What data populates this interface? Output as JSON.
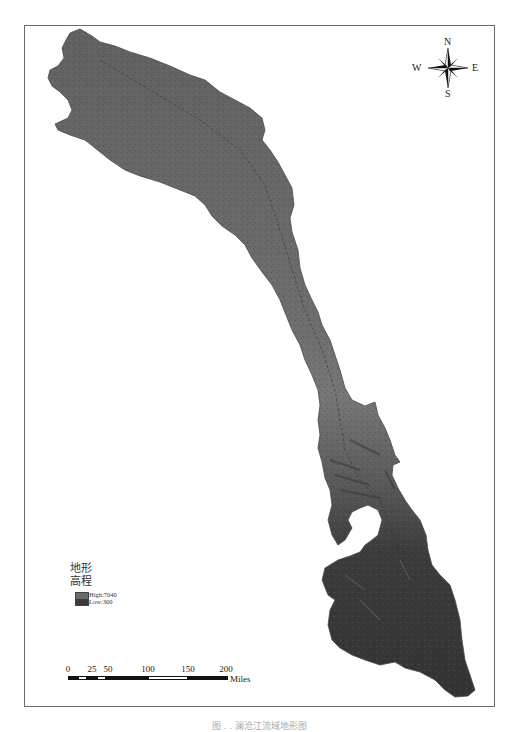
{
  "map": {
    "title": "",
    "colors": {
      "frame": "#6a6a6a",
      "terrain_high": "#6a6a6a",
      "terrain_mid": "#757575",
      "terrain_low": "#353535",
      "background": "#ffffff"
    }
  },
  "compass": {
    "n": "N",
    "s": "S",
    "e": "E",
    "w": "W"
  },
  "legend": {
    "title_line1": "地形",
    "title_line2": "高程",
    "high_label": "High:7040",
    "low_label": "Low:300"
  },
  "scale_bar": {
    "ticks": [
      "0",
      "25",
      "50",
      "100",
      "150",
      "200"
    ],
    "units": "Miles"
  },
  "caption": "图 . .   澜沧江流域地形图"
}
